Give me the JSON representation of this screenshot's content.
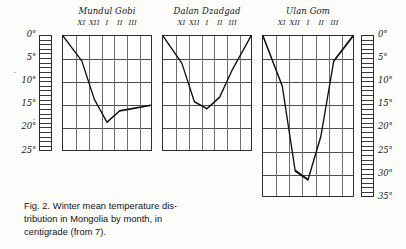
{
  "figure": {
    "caption_lines": [
      "Fig. 2. Winter mean temperature dis-",
      "tribution in Mongolia by month, in",
      "centigrade (from 7)."
    ],
    "caption_full": "Fig. 2. Winter mean temperature distribution in Mongolia by month, in centigrade (from 7)."
  },
  "axes": {
    "left_scale": {
      "name": "left-temperature-ruler",
      "unit": "°C below zero",
      "min": 0,
      "max": 25,
      "tick_step": 1,
      "label_step": 5,
      "labels": [
        "0°",
        "5°",
        "10°",
        "15°",
        "20°",
        "25°"
      ],
      "label_values": [
        0,
        5,
        10,
        15,
        20,
        25
      ]
    },
    "right_scale": {
      "name": "right-temperature-ruler",
      "unit": "°C below zero",
      "min": 0,
      "max": 35,
      "tick_step": 1,
      "label_step": 5,
      "labels": [
        "0°",
        "5°",
        "10°",
        "15°",
        "20°",
        "25°",
        "30°",
        "35°"
      ],
      "label_values": [
        0,
        5,
        10,
        15,
        20,
        25,
        30,
        35
      ]
    }
  },
  "chart_data": [
    {
      "type": "line",
      "name": "mandal-gobi",
      "title": "Mundul Gobi",
      "xlabel": "",
      "ylabel": "",
      "categories": [
        "XI",
        "XII",
        "I",
        "II",
        "III"
      ],
      "tick_labels": [
        "XI",
        "XII",
        "I",
        "II",
        "III"
      ],
      "values": [
        5.5,
        14.0,
        19.0,
        16.5,
        16.0
      ],
      "ylim": [
        0,
        25
      ],
      "ygrid_values": [
        0,
        5,
        10,
        15,
        20,
        25
      ],
      "grid": true,
      "columns": 7,
      "note": "values are degrees centigrade below zero; curve descends off-panel at both ends"
    },
    {
      "type": "line",
      "name": "dalan-dzadgad",
      "title": "Dalan Dzadgad",
      "xlabel": "",
      "ylabel": "",
      "categories": [
        "XI",
        "XII",
        "I",
        "II",
        "III"
      ],
      "tick_labels": [
        "XI",
        "XII",
        "I",
        "II",
        "III"
      ],
      "values": [
        6.0,
        14.5,
        16.0,
        13.5,
        7.5
      ],
      "ylim": [
        0,
        25
      ],
      "ygrid_values": [
        0,
        5,
        10,
        15,
        20,
        25
      ],
      "grid": true,
      "columns": 7,
      "note": "values are degrees centigrade below zero"
    },
    {
      "type": "line",
      "name": "ulan-gom",
      "title": "Ulan Gom",
      "xlabel": "",
      "ylabel": "",
      "categories": [
        "XI",
        "XII",
        "I",
        "II",
        "III"
      ],
      "tick_labels": [
        "XI",
        "XII",
        "I",
        "II",
        "III"
      ],
      "values": [
        11.0,
        29.5,
        31.5,
        22.0,
        5.5
      ],
      "ylim": [
        0,
        35
      ],
      "ygrid_values": [
        0,
        5,
        10,
        15,
        20,
        25,
        30,
        35
      ],
      "grid": true,
      "columns": 7,
      "note": "values are degrees centigrade below zero; deepest minimum of the three stations"
    }
  ]
}
